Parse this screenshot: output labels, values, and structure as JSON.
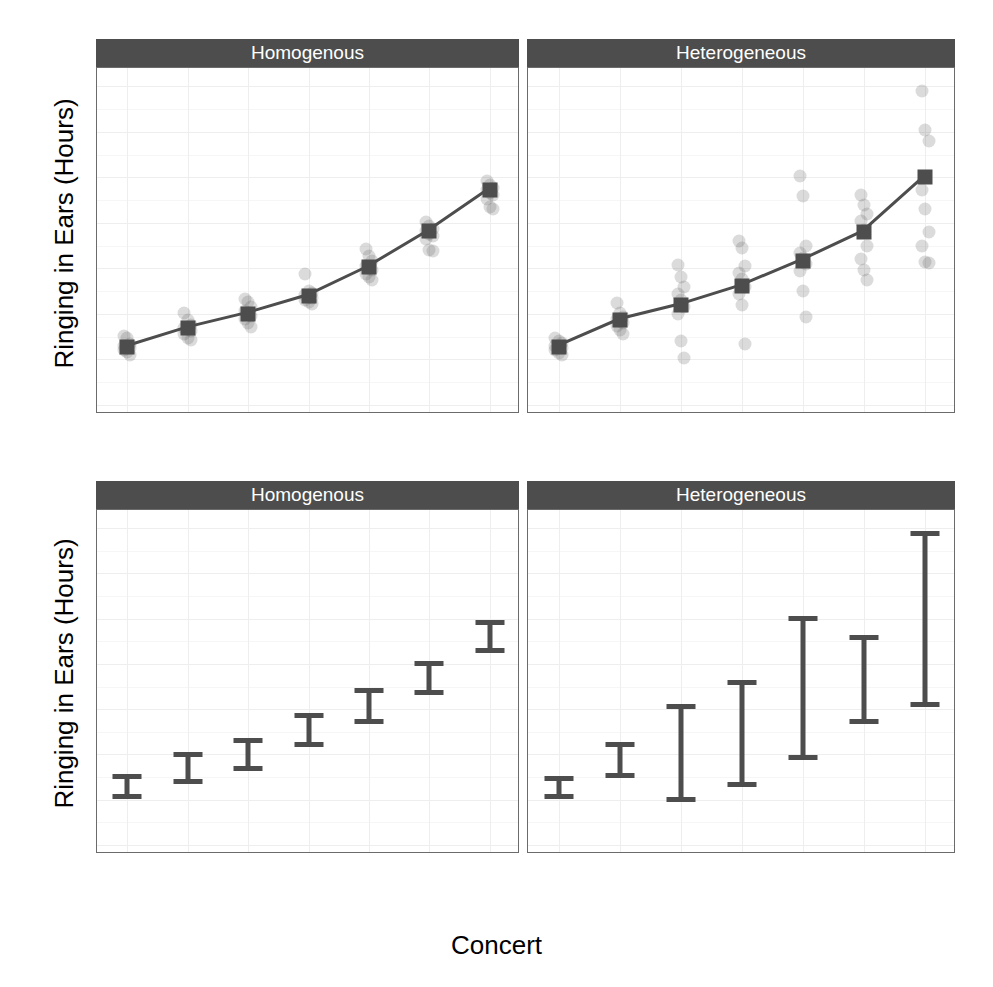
{
  "figure": {
    "width": 993,
    "height": 987,
    "background": "#ffffff",
    "strip_fill": "#4d4d4d",
    "strip_text_color": "#ffffff",
    "mark_color": "#4d4d4d",
    "jitter_color": "#5a5a5a",
    "grid_color": "#eeeeee",
    "panel_border_color": "#6b6b6b"
  },
  "axis": {
    "y_title": "Ringing in Ears (Hours)",
    "x_title": "Concert",
    "y_ticks": [
      "0",
      "10",
      "20",
      "30",
      "40",
      "50",
      "60",
      "70"
    ],
    "x_ticks": [
      "Brixton",
      "Brighton",
      "Bristol",
      "Edinburgh",
      "Newcastle",
      "Cardiff",
      "Dublin"
    ]
  },
  "strips": {
    "homogenous": "Homogenous",
    "heterogeneous": "Heterogeneous"
  },
  "chart_data": [
    {
      "id": "top-left",
      "type": "scatter",
      "title": "Homogenous",
      "xlabel": "Concert",
      "ylabel": "Ringing in Ears (Hours)",
      "ylim": [
        -2,
        74
      ],
      "yticks": [
        0,
        10,
        20,
        30,
        40,
        50,
        60,
        70
      ],
      "grid": true,
      "legend": "none",
      "categories": [
        "Brixton",
        "Brighton",
        "Bristol",
        "Edinburgh",
        "Newcastle",
        "Cardiff",
        "Dublin"
      ],
      "series": [
        {
          "name": "Mean (line + square)",
          "values": [
            12.7,
            16.8,
            20.0,
            23.9,
            30.2,
            38.1,
            47.2
          ]
        }
      ],
      "points": [
        {
          "category": "Brixton",
          "values": [
            15.2,
            14.6,
            13.4,
            12.9,
            12.6,
            12.4,
            12.0,
            11.6,
            11.0
          ]
        },
        {
          "category": "Brighton",
          "values": [
            20.2,
            18.6,
            17.6,
            17.0,
            16.6,
            16.2,
            15.6,
            14.7,
            14.2
          ]
        },
        {
          "category": "Bristol",
          "values": [
            23.2,
            22.6,
            21.6,
            20.6,
            20.1,
            19.6,
            18.8,
            17.9,
            17.1
          ]
        },
        {
          "category": "Edinburgh",
          "values": [
            28.7,
            25.1,
            24.6,
            24.1,
            23.8,
            23.4,
            23.0,
            22.6,
            22.2
          ]
        },
        {
          "category": "Newcastle",
          "values": [
            34.2,
            32.6,
            31.6,
            30.6,
            30.1,
            29.6,
            28.8,
            28.0,
            27.4
          ]
        },
        {
          "category": "Cardiff",
          "values": [
            40.2,
            39.4,
            38.6,
            38.1,
            37.6,
            37.1,
            36.4,
            34.0,
            33.8
          ]
        },
        {
          "category": "Dublin",
          "values": [
            49.2,
            48.4,
            47.6,
            47.1,
            46.6,
            46.1,
            45.2,
            43.4,
            43.0
          ]
        }
      ]
    },
    {
      "id": "top-right",
      "type": "scatter",
      "title": "Heterogeneous",
      "xlabel": "Concert",
      "ylabel": "Ringing in Ears (Hours)",
      "ylim": [
        -2,
        74
      ],
      "yticks": [
        0,
        10,
        20,
        30,
        40,
        50,
        60,
        70
      ],
      "grid": true,
      "legend": "none",
      "categories": [
        "Brixton",
        "Brighton",
        "Bristol",
        "Edinburgh",
        "Newcastle",
        "Cardiff",
        "Dublin"
      ],
      "series": [
        {
          "name": "Mean (line + square)",
          "values": [
            12.8,
            18.6,
            21.9,
            26.1,
            31.7,
            38.0,
            50.0
          ]
        }
      ],
      "points": [
        {
          "category": "Brixton",
          "values": [
            14.8,
            14.0,
            13.5,
            13.0,
            12.7,
            12.4,
            12.0,
            11.4,
            10.9
          ]
        },
        {
          "category": "Brighton",
          "values": [
            22.4,
            20.1,
            19.4,
            18.8,
            18.4,
            18.0,
            17.4,
            16.4,
            15.5
          ]
        },
        {
          "category": "Bristol",
          "values": [
            30.8,
            28.0,
            25.8,
            24.4,
            23.0,
            21.6,
            20.0,
            14.0,
            10.2
          ]
        },
        {
          "category": "Edinburgh",
          "values": [
            35.9,
            34.4,
            30.6,
            29.0,
            27.6,
            26.0,
            24.4,
            22.0,
            13.4
          ]
        },
        {
          "category": "Newcastle",
          "values": [
            50.2,
            45.8,
            35.0,
            33.4,
            32.2,
            31.0,
            29.4,
            25.0,
            19.4
          ]
        },
        {
          "category": "Cardiff",
          "values": [
            46.0,
            44.0,
            42.0,
            40.4,
            38.4,
            35.0,
            32.0,
            29.6,
            27.4
          ]
        },
        {
          "category": "Dublin",
          "values": [
            69.0,
            60.4,
            58.0,
            47.2,
            43.0,
            38.0,
            35.0,
            31.4,
            31.2
          ]
        }
      ]
    },
    {
      "id": "bottom-left",
      "type": "errorbar",
      "title": "Homogenous",
      "xlabel": "Concert",
      "ylabel": "Ringing in Ears (Hours)",
      "ylim": [
        -2,
        74
      ],
      "yticks": [
        0,
        10,
        20,
        30,
        40,
        50,
        60,
        70
      ],
      "grid": true,
      "legend": "none",
      "categories": [
        "Brixton",
        "Brighton",
        "Bristol",
        "Edinburgh",
        "Newcastle",
        "Cardiff",
        "Dublin"
      ],
      "lower": [
        10.9,
        14.2,
        17.1,
        22.2,
        27.4,
        33.8,
        43.0
      ],
      "upper": [
        15.2,
        20.2,
        23.2,
        28.7,
        34.2,
        40.2,
        49.2
      ]
    },
    {
      "id": "bottom-right",
      "type": "errorbar",
      "title": "Heterogeneous",
      "xlabel": "Concert",
      "ylabel": "Ringing in Ears (Hours)",
      "ylim": [
        -2,
        74
      ],
      "yticks": [
        0,
        10,
        20,
        30,
        40,
        50,
        60,
        70
      ],
      "grid": true,
      "legend": "none",
      "categories": [
        "Brixton",
        "Brighton",
        "Bristol",
        "Edinburgh",
        "Newcastle",
        "Cardiff",
        "Dublin"
      ],
      "lower": [
        10.9,
        15.5,
        10.2,
        13.4,
        19.4,
        27.4,
        31.2
      ],
      "upper": [
        14.8,
        22.4,
        30.8,
        35.9,
        50.2,
        46.0,
        69.0
      ]
    }
  ]
}
